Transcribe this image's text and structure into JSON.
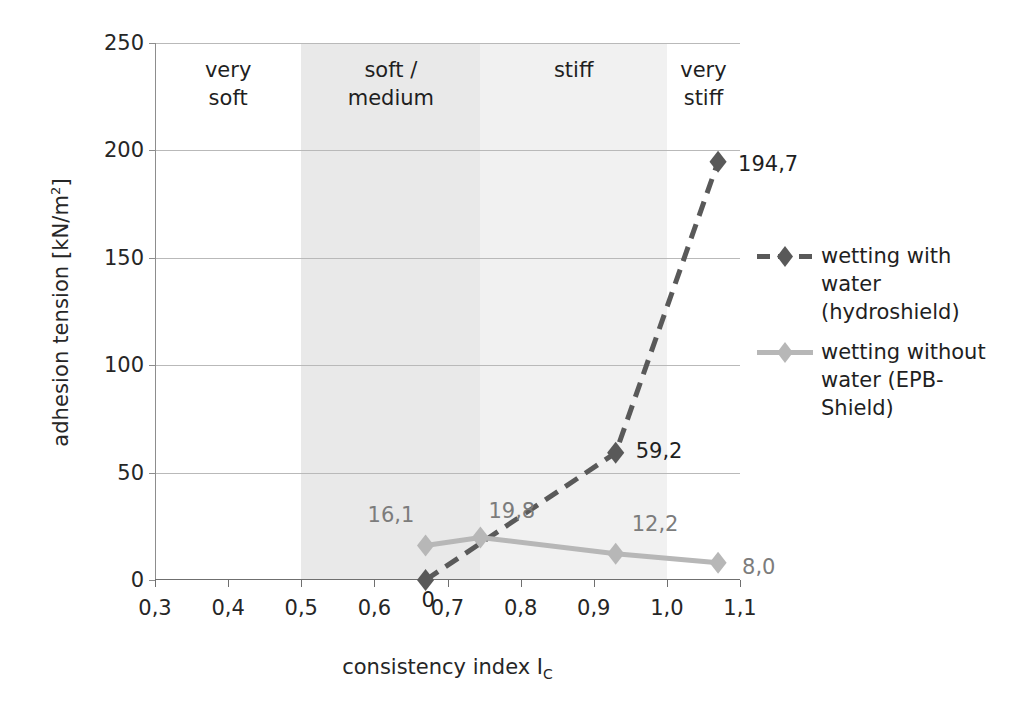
{
  "chart_data": {
    "type": "line",
    "title": "",
    "xlabel": "consistency index I_C",
    "xlabel_main": "consistency index I",
    "xlabel_sub": "C",
    "ylabel": "adhesion tension [kN/m²]",
    "ylabel_main": "adhesion tension [kN/m",
    "ylabel_sup": "2",
    "ylabel_tail": "]",
    "xlim": [
      0.3,
      1.1
    ],
    "ylim": [
      0,
      250
    ],
    "grid": true,
    "legend_position": "right",
    "xticks": [
      "0,3",
      "0,4",
      "0,5",
      "0,6",
      "0,7",
      "0,8",
      "0,9",
      "1,0",
      "1,1"
    ],
    "xtick_values": [
      0.3,
      0.4,
      0.5,
      0.6,
      0.7,
      0.8,
      0.9,
      1.0,
      1.1
    ],
    "yticks": [
      "0",
      "50",
      "100",
      "150",
      "200",
      "250"
    ],
    "ytick_values": [
      0,
      50,
      100,
      150,
      200,
      250
    ],
    "series": [
      {
        "name": "wetting with water (hydroshield)",
        "color": "#595959",
        "style": "dashed",
        "marker": "diamond",
        "x": [
          0.67,
          0.93,
          1.07
        ],
        "y": [
          0,
          59.2,
          194.7
        ],
        "labels": [
          "0",
          "59,2",
          "194,7"
        ]
      },
      {
        "name": "wetting without water (EPB-Shield)",
        "color": "#b7b7b7",
        "style": "solid",
        "marker": "diamond",
        "x": [
          0.67,
          0.745,
          0.93,
          1.07
        ],
        "y": [
          16.1,
          19.8,
          12.2,
          8.0
        ],
        "labels": [
          "16,1",
          "19,8",
          "12,2",
          "8,0"
        ]
      }
    ],
    "bands": [
      {
        "label": "very\nsoft",
        "label_line1": "very",
        "label_line2": "soft",
        "from": 0.3,
        "to": 0.5,
        "color": "#ffffff"
      },
      {
        "label": "soft /\nmedium",
        "label_line1": "soft /",
        "label_line2": "medium",
        "from": 0.5,
        "to": 0.745,
        "color": "#e9e9e9"
      },
      {
        "label": "stiff",
        "label_line1": "stiff",
        "label_line2": "",
        "from": 0.745,
        "to": 1.0,
        "color": "#f1f1f1"
      },
      {
        "label": "very\nstiff",
        "label_line1": "very",
        "label_line2": "stiff",
        "from": 1.0,
        "to": 1.1,
        "color": "#ffffff"
      }
    ]
  },
  "legend": {
    "items": [
      {
        "label": "wetting with water (hydroshield)",
        "color": "#595959",
        "style": "dashed"
      },
      {
        "label": "wetting without water (EPB-Shield)",
        "color": "#b7b7b7",
        "style": "solid"
      }
    ]
  }
}
